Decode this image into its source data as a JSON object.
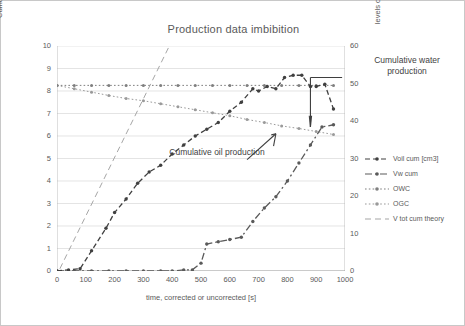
{
  "chart_data": {
    "type": "line",
    "title": "Production data imbibition",
    "xlabel": "time, corrected or uncorrected [s]",
    "ylabel_left": "Cumulative volumes [cm3]",
    "ylabel_right": "levels of interfaces in burette, height [cm]",
    "xlim": [
      0,
      1000
    ],
    "ylim_left": [
      0,
      10
    ],
    "ylim_right": [
      0,
      60
    ],
    "xticks": [
      0,
      100,
      200,
      300,
      400,
      500,
      600,
      700,
      800,
      900,
      1000
    ],
    "yticks_left": [
      0,
      1,
      2,
      3,
      4,
      5,
      6,
      7,
      8,
      9,
      10
    ],
    "yticks_right": [
      0,
      10,
      20,
      30,
      40,
      50,
      60
    ],
    "grid": true,
    "legend_position": "right",
    "series": [
      {
        "name": "Voil cum [cm3]",
        "axis": "left",
        "color": "#404040",
        "style": "dashed-marker",
        "x": [
          0,
          40,
          80,
          120,
          170,
          200,
          240,
          280,
          320,
          360,
          400,
          440,
          480,
          520,
          560,
          600,
          640,
          680,
          700,
          730,
          760,
          790,
          820,
          850,
          880,
          900,
          930,
          960
        ],
        "y": [
          0.0,
          0.05,
          0.1,
          0.9,
          1.9,
          2.6,
          3.2,
          3.9,
          4.4,
          4.7,
          5.2,
          5.6,
          6.0,
          6.3,
          6.6,
          7.1,
          7.5,
          8.1,
          8.0,
          8.2,
          8.1,
          8.6,
          8.7,
          8.7,
          8.2,
          8.2,
          8.3,
          7.2
        ]
      },
      {
        "name": "Vw cum",
        "axis": "left",
        "color": "#5a5a5a",
        "style": "dashdot-marker",
        "x": [
          0,
          60,
          120,
          180,
          240,
          300,
          360,
          400,
          440,
          470,
          500,
          520,
          560,
          600,
          640,
          680,
          720,
          760,
          800,
          840,
          880,
          920,
          960
        ],
        "y": [
          0.0,
          0.0,
          0.0,
          0.0,
          0.0,
          0.0,
          0.0,
          0.0,
          0.05,
          0.05,
          0.35,
          1.2,
          1.3,
          1.4,
          1.5,
          2.2,
          2.8,
          3.3,
          4.0,
          4.8,
          5.6,
          6.4,
          6.5
        ]
      },
      {
        "name": "OWC",
        "axis": "right",
        "color": "#7f7f7f",
        "style": "dotted-marker",
        "x": [
          0,
          60,
          120,
          180,
          240,
          300,
          360,
          420,
          480,
          540,
          600,
          660,
          720,
          780,
          840,
          900,
          960
        ],
        "y": [
          49.5,
          49.5,
          49.5,
          49.5,
          49.5,
          49.5,
          49.5,
          49.5,
          49.5,
          49.5,
          49.5,
          49.5,
          49.5,
          49.5,
          49.5,
          49.5,
          49.5
        ]
      },
      {
        "name": "OGC",
        "axis": "right",
        "color": "#9a9a9a",
        "style": "dotted-marker",
        "x": [
          0,
          60,
          120,
          180,
          240,
          300,
          360,
          420,
          480,
          540,
          600,
          660,
          720,
          780,
          840,
          900,
          960
        ],
        "y": [
          49.5,
          48.6,
          47.7,
          46.8,
          46.0,
          45.4,
          44.6,
          43.8,
          43.0,
          42.2,
          41.4,
          40.4,
          39.6,
          38.7,
          38.0,
          37.2,
          36.4
        ]
      },
      {
        "name": "V tot cum theory",
        "axis": "left",
        "color": "#a6a6a6",
        "style": "dashed-line",
        "x": [
          10,
          390
        ],
        "y": [
          0.1,
          10.0
        ]
      }
    ],
    "annotations": [
      {
        "id": "water",
        "text": "Cumulative water production",
        "x": 900,
        "y": 8.5
      },
      {
        "id": "oil",
        "text": "Cumulative oil production",
        "x": 520,
        "y": 5.0
      }
    ]
  },
  "legend": {
    "items": [
      {
        "label": "Voil cum [cm3]"
      },
      {
        "label": "Vw cum"
      },
      {
        "label": "OWC"
      },
      {
        "label": "OGC"
      },
      {
        "label": "V tot cum theory"
      }
    ]
  }
}
